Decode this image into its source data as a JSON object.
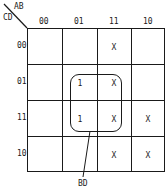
{
  "kmap": {
    "row_var": "CD",
    "col_var": "AB",
    "col_labels": [
      "00",
      "01",
      "11",
      "10"
    ],
    "row_labels": [
      "00",
      "01",
      "11",
      "10"
    ],
    "cells": [
      [
        "",
        "",
        "X",
        ""
      ],
      [
        "",
        "1",
        "X",
        ""
      ],
      [
        "",
        "1",
        "X",
        "X"
      ],
      [
        "",
        "",
        "X",
        "X"
      ]
    ],
    "group_label": "BD"
  }
}
